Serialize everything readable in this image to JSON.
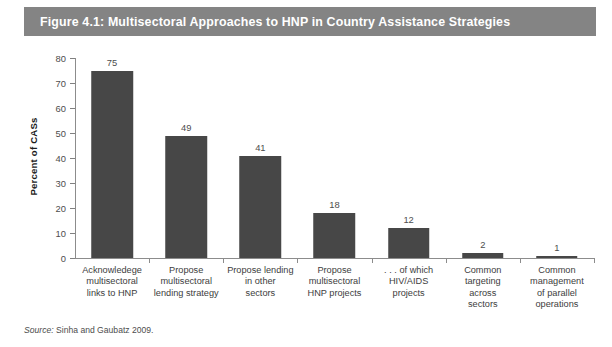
{
  "figure": {
    "title": "Figure 4.1: Multisectoral Approaches to HNP in Country Assistance Strategies",
    "banner_color": "#848484",
    "banner_text_color": "#ffffff"
  },
  "source": {
    "label": "Source:",
    "text": "Sinha and Gaubatz 2009."
  },
  "chart_data": {
    "type": "bar",
    "title": "Figure 4.1: Multisectoral Approaches to HNP in Country Assistance Strategies",
    "xlabel": "",
    "ylabel": "Percent of CASs",
    "ylim": [
      0,
      80
    ],
    "yticks": [
      0,
      10,
      20,
      30,
      40,
      50,
      60,
      70,
      80
    ],
    "grid": false,
    "legend": null,
    "bar_color": "#474747",
    "categories": [
      "Acknowledege multisectoral links to HNP",
      "Propose multisectoral lending strategy",
      "Propose lending in other sectors",
      "Propose multisectoral HNP projects",
      ". . . of which HIV/AIDS projects",
      "Common targeting across sectors",
      "Common management of parallel operations"
    ],
    "category_lines": [
      [
        "Acknowledege",
        "multisectoral",
        "links to HNP"
      ],
      [
        "Propose",
        "multisectoral",
        "lending strategy"
      ],
      [
        "Propose lending",
        "in other",
        "sectors"
      ],
      [
        "Propose",
        "multisectoral",
        "HNP projects"
      ],
      [
        ". . . of which",
        "HIV/AIDS",
        "projects"
      ],
      [
        "Common",
        "targeting",
        "across",
        "sectors"
      ],
      [
        "Common",
        "management",
        "of parallel",
        "operations"
      ]
    ],
    "values": [
      75,
      49,
      41,
      18,
      12,
      2,
      1
    ],
    "value_labels": [
      "75",
      "49",
      "41",
      "18",
      "12",
      "2",
      "1"
    ]
  }
}
